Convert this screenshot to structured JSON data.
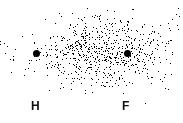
{
  "diagram": {
    "type": "electron-density-cloud",
    "atoms": [
      {
        "symbol": "H",
        "nucleus": {
          "x": 36,
          "y": 53
        },
        "label_pos": {
          "x": 31,
          "y": 100
        }
      },
      {
        "symbol": "F",
        "nucleus": {
          "x": 127,
          "y": 53
        },
        "label_pos": {
          "x": 122,
          "y": 100
        }
      }
    ],
    "cloud": {
      "center_x": 98,
      "center_y": 52,
      "radius_x": 62,
      "radius_y": 34,
      "dense_center_x": 100,
      "color": "#000000",
      "halo_extent_x": [
        0,
        178
      ],
      "halo_extent_y": [
        6,
        96
      ]
    }
  }
}
